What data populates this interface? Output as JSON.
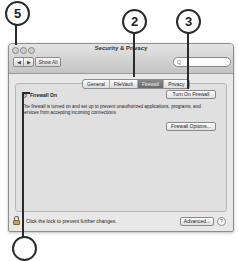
{
  "callouts": [
    {
      "label": "5"
    },
    {
      "label": "2"
    },
    {
      "label": "3"
    },
    {
      "label": ""
    }
  ],
  "window": {
    "title": "Security & Privacy",
    "toolbar": {
      "back_glyph": "◀",
      "forward_glyph": "▶",
      "show_all_label": "Show All",
      "search_icon": "search-icon",
      "search_glyph": "Q",
      "search_placeholder": ""
    },
    "tabs": [
      {
        "label": "General",
        "selected": false
      },
      {
        "label": "FileVault",
        "selected": false
      },
      {
        "label": "Firewall",
        "selected": true
      },
      {
        "label": "Privacy",
        "selected": false
      }
    ],
    "firewall": {
      "status_label": "Firewall On",
      "turn_on_button": "Turn On Firewall",
      "description": "The firewall is turned on and set up to prevent unauthorized applications, programs, and services from accepting incoming connections.",
      "options_button": "Firewall Options..."
    },
    "footer": {
      "lock_text": "Click the lock to prevent further changes.",
      "advanced_button": "Advanced...",
      "help_glyph": "?"
    }
  },
  "colors": {
    "selected_tab": "#777777",
    "window_bg": "#e8e8e8",
    "panel_bg": "#e0e0e0"
  }
}
